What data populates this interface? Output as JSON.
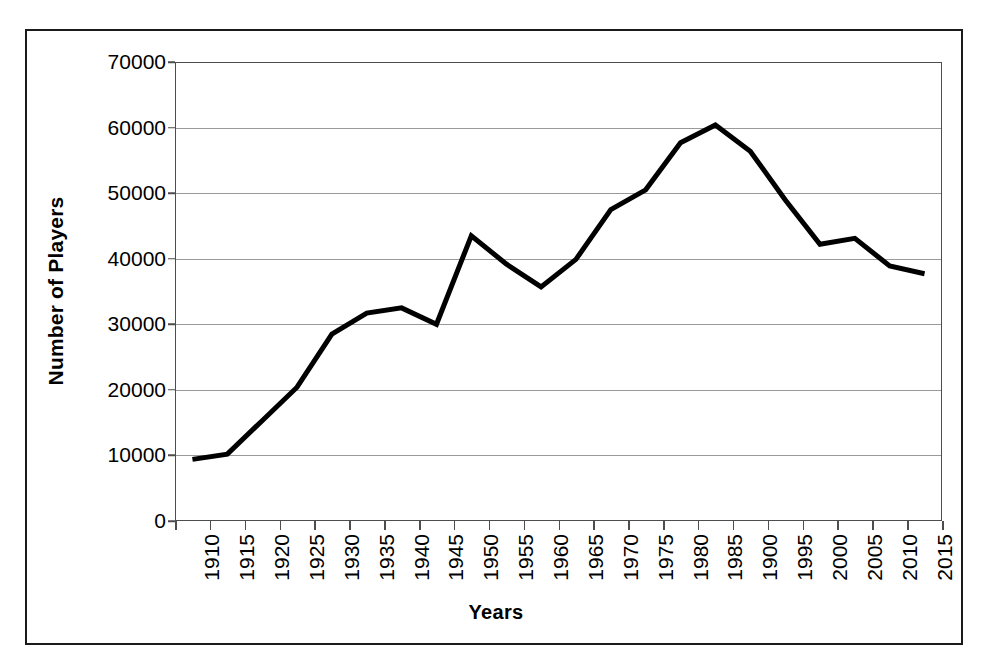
{
  "chart_data": {
    "type": "line",
    "title": "",
    "xlabel": "Years",
    "ylabel": "Number of Players",
    "categories": [
      "1910",
      "1915",
      "1920",
      "1925",
      "1930",
      "1935",
      "1940",
      "1945",
      "1950",
      "1955",
      "1960",
      "1965",
      "1970",
      "1975",
      "1980",
      "1985",
      "1900",
      "1995",
      "2000",
      "2005",
      "2010",
      "2015"
    ],
    "values": [
      9400,
      10200,
      15300,
      20400,
      28500,
      31700,
      32500,
      30000,
      43500,
      39200,
      35700,
      39900,
      47500,
      50500,
      57700,
      60400,
      56400,
      49000,
      42200,
      43100,
      38900,
      37700
    ],
    "series": [
      {
        "name": "Number of Players",
        "values": [
          9400,
          10200,
          15300,
          20400,
          28500,
          31700,
          32500,
          30000,
          43500,
          39200,
          35700,
          39900,
          47500,
          50500,
          57700,
          60400,
          56400,
          49000,
          42200,
          43100,
          38900,
          37700
        ]
      }
    ],
    "ylim": [
      0,
      70000
    ],
    "ytick_labels": [
      "0",
      "10000",
      "20000",
      "30000",
      "40000",
      "50000",
      "60000",
      "70000"
    ],
    "ytick_values": [
      0,
      10000,
      20000,
      30000,
      40000,
      50000,
      60000,
      70000
    ],
    "grid": "horizontal",
    "legend": "none",
    "line_color": "#000000",
    "gridline_color": "#9a9a9a",
    "axis_color": "#4d4d4d",
    "frame_color": "#1a1a1a",
    "background_color": "#ffffff",
    "xtick_rotation": -90
  }
}
